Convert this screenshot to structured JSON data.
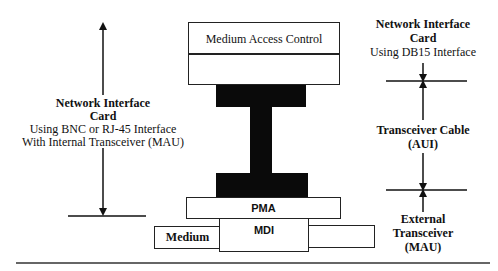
{
  "diagram": {
    "center_stack": {
      "mac_label": "Medium Access Control",
      "pma_label": "PMA",
      "mdi_label": "MDI",
      "medium_label": "Medium"
    },
    "left_annotation": {
      "title_line1": "Network Interface",
      "title_line2": "Card",
      "desc_line1": "Using BNC or RJ-45 Interface",
      "desc_line2": "With Internal Transceiver (MAU)"
    },
    "right_annotation": {
      "top_title_line1": "Network Interface",
      "top_title_line2": "Card",
      "top_desc": "Using DB15 Interface",
      "middle_line1": "Transceiver Cable",
      "middle_line2": "(AUI)",
      "bottom_line1": "External",
      "bottom_line2": "Transceiver",
      "bottom_line3": "(MAU)"
    },
    "colors": {
      "stroke": "#222222",
      "fill_dark": "#0a0a0a",
      "background": "#ffffff"
    }
  }
}
